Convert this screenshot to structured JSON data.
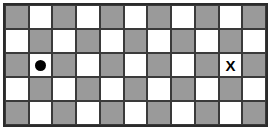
{
  "board": {
    "name": "checkerboard",
    "columns": 11,
    "rows": 5,
    "light_color": "#ffffff",
    "dark_color": "#9a9a9a",
    "gridline_color": "#3a3a3a",
    "border_color": "#2b2b2b",
    "background_color": "#ffffff",
    "pattern_start": "dark",
    "cells": [
      [
        "dark",
        "light",
        "dark",
        "light",
        "dark",
        "light",
        "dark",
        "light",
        "dark",
        "light",
        "dark"
      ],
      [
        "light",
        "dark",
        "light",
        "dark",
        "light",
        "dark",
        "light",
        "dark",
        "light",
        "dark",
        "light"
      ],
      [
        "dark",
        "light",
        "dark",
        "light",
        "dark",
        "light",
        "dark",
        "light",
        "dark",
        "light",
        "dark"
      ],
      [
        "light",
        "dark",
        "light",
        "dark",
        "light",
        "dark",
        "light",
        "dark",
        "light",
        "dark",
        "light"
      ],
      [
        "dark",
        "light",
        "dark",
        "light",
        "dark",
        "light",
        "dark",
        "light",
        "dark",
        "light",
        "dark"
      ]
    ],
    "markers": [
      {
        "id": "dot-marker",
        "glyph": "●",
        "type": "dot",
        "label": "●",
        "row": 3,
        "column": 2,
        "color": "#000000"
      },
      {
        "id": "x-marker",
        "glyph": "X",
        "type": "letter",
        "label": "X",
        "row": 3,
        "column": 10,
        "color": "#000000"
      }
    ]
  }
}
